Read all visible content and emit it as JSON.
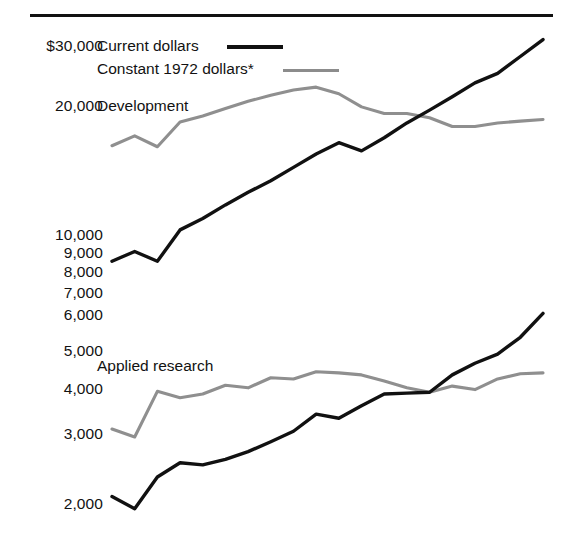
{
  "legend": {
    "items": [
      {
        "label": "Current dollars",
        "color": "#111111",
        "key": "current"
      },
      {
        "label": "Constant 1972 dollars*",
        "color": "#8f8f8f",
        "key": "constant"
      }
    ]
  },
  "panels": [
    {
      "name": "Development",
      "label": "Development"
    },
    {
      "name": "Applied research",
      "label": "Applied research"
    }
  ],
  "axis": {
    "ticks": [
      {
        "label": "$30,000",
        "value": 30000,
        "y": 45
      },
      {
        "label": "20,000",
        "value": 20000,
        "y": 105
      },
      {
        "label": "10,000",
        "value": 10000,
        "y": 234
      },
      {
        "label": "9,000",
        "value": 9000,
        "y": 252
      },
      {
        "label": "8,000",
        "value": 8000,
        "y": 271
      },
      {
        "label": "7,000",
        "value": 7000,
        "y": 292
      },
      {
        "label": "6,000",
        "value": 6000,
        "y": 314
      },
      {
        "label": "5,000",
        "value": 5000,
        "y": 350
      },
      {
        "label": "4,000",
        "value": 4000,
        "y": 388
      },
      {
        "label": "3,000",
        "value": 3000,
        "y": 433
      },
      {
        "label": "2,000",
        "value": 2000,
        "y": 503
      }
    ]
  },
  "chart_data": {
    "type": "line",
    "title": "",
    "xlabel": "",
    "ylabel": "",
    "scale": "log",
    "ylim": [
      1700,
      33000
    ],
    "grid": false,
    "legend_position": "top-left",
    "panels": [
      {
        "name": "Development",
        "series": [
          {
            "name": "Current dollars",
            "color": "#111111",
            "values": [
              8200,
              8700,
              8200,
              9900,
              10600,
              11500,
              12400,
              13300,
              14400,
              15600,
              16700,
              15900,
              17200,
              18800,
              20300,
              22000,
              23900,
              25300,
              28000,
              31000
            ]
          },
          {
            "name": "Constant 1972 dollars*",
            "color": "#8f8f8f",
            "values": [
              16400,
              17400,
              16300,
              18900,
              19600,
              20500,
              21400,
              22200,
              22900,
              23300,
              22400,
              20700,
              19900,
              19900,
              19400,
              18400,
              18400,
              18800,
              19000,
              19200
            ]
          }
        ]
      },
      {
        "name": "Applied research",
        "series": [
          {
            "name": "Current dollars",
            "color": "#111111",
            "values": [
              2000,
              1860,
              2250,
              2450,
              2420,
              2500,
              2620,
              2780,
              2960,
              3280,
              3200,
              3450,
              3700,
              3720,
              3740,
              4150,
              4450,
              4700,
              5200,
              6000
            ]
          },
          {
            "name": "Constant 1972 dollars*",
            "color": "#8f8f8f",
            "values": [
              3000,
              2860,
              3760,
              3620,
              3700,
              3900,
              3840,
              4080,
              4050,
              4230,
              4200,
              4150,
              4000,
              3840,
              3740,
              3880,
              3800,
              4050,
              4180,
              4200
            ]
          }
        ]
      }
    ]
  },
  "geometry": {
    "plot_left": 112,
    "plot_right": 543,
    "log_top_y": 45,
    "log_top_value": 30000,
    "px_per_decade": 384
  }
}
